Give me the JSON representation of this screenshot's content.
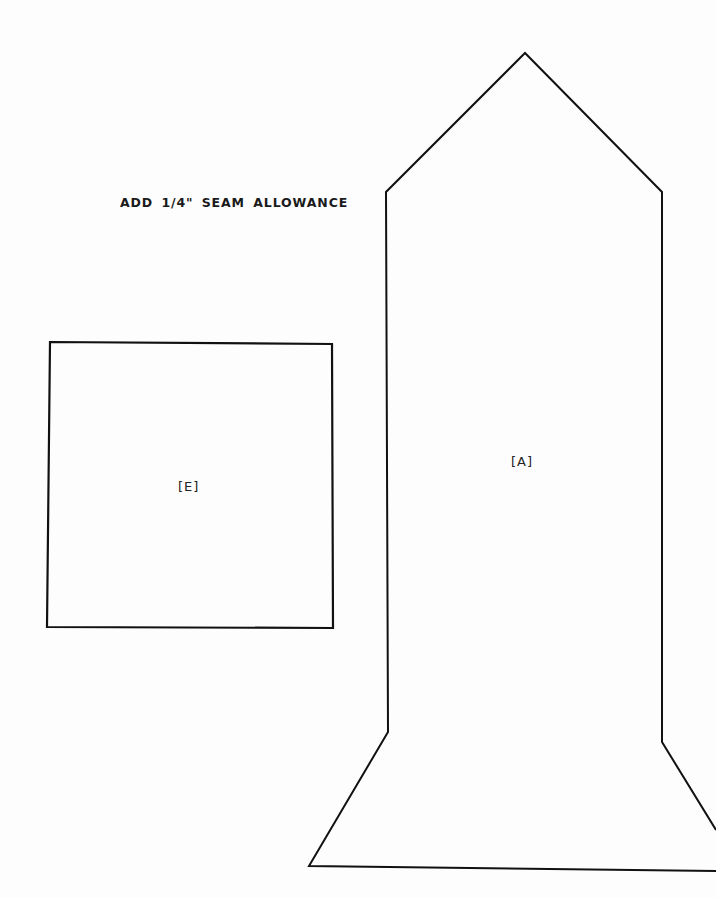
{
  "instruction": "ADD 1/4\" SEAM ALLOWANCE",
  "pieces": [
    {
      "id": "E",
      "label": "[E]",
      "shape": "square"
    },
    {
      "id": "A",
      "label": "[A]",
      "shape": "pointed-top column with flared base"
    }
  ],
  "colors": {
    "line": "#111111",
    "background": "#fdfdfd"
  }
}
